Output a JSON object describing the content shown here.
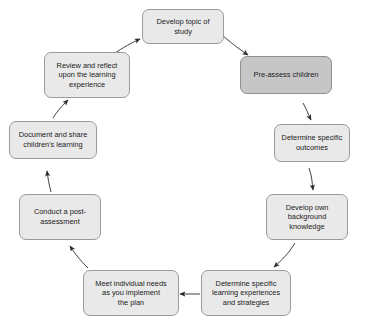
{
  "diagram": {
    "type": "cycle-flowchart",
    "direction": "clockwise",
    "background_color": "#ffffff",
    "node_fill_color": "#e9e9e9",
    "node_highlight_fill_color": "#c6c6c6",
    "node_border_color": "#9a9a9a",
    "arrow_color": "#2b2b2b",
    "nodes": [
      {
        "id": "develop-topic",
        "label": "Develop topic of study",
        "highlighted": false
      },
      {
        "id": "pre-assess",
        "label": "Pre-assess children",
        "highlighted": true
      },
      {
        "id": "determine-outcomes",
        "label": "Determine specific\noutcomes",
        "highlighted": false
      },
      {
        "id": "develop-background",
        "label": "Develop own\nbackground\nknowledge",
        "highlighted": false
      },
      {
        "id": "determine-experiences",
        "label": "Determine specific\nlearning experiences\nand strategies",
        "highlighted": false
      },
      {
        "id": "meet-needs",
        "label": "Meet individual needs\nas you implement\nthe plan",
        "highlighted": false
      },
      {
        "id": "post-assessment",
        "label": "Conduct a post-\nassessment",
        "highlighted": false
      },
      {
        "id": "document-share",
        "label": "Document and share\nchildren's learning",
        "highlighted": false
      },
      {
        "id": "review-reflect",
        "label": "Review and reflect\nupon the learning\nexperience",
        "highlighted": false
      }
    ],
    "edges": [
      {
        "from": "develop-topic",
        "to": "pre-assess"
      },
      {
        "from": "pre-assess",
        "to": "determine-outcomes"
      },
      {
        "from": "determine-outcomes",
        "to": "develop-background"
      },
      {
        "from": "develop-background",
        "to": "determine-experiences"
      },
      {
        "from": "determine-experiences",
        "to": "meet-needs"
      },
      {
        "from": "meet-needs",
        "to": "post-assessment"
      },
      {
        "from": "post-assessment",
        "to": "document-share"
      },
      {
        "from": "document-share",
        "to": "review-reflect"
      },
      {
        "from": "review-reflect",
        "to": "develop-topic"
      }
    ]
  }
}
